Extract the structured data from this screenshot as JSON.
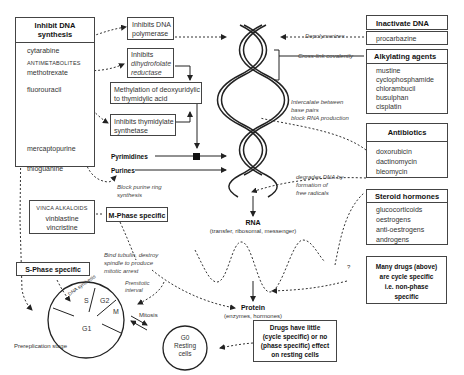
{
  "inhibit_dna_synthesis": {
    "title_line1": "Inhibit DNA",
    "title_line2": "synthesis",
    "drugs": {
      "cytarabine": "cytarabine",
      "antimetabolites_label": "ANTIMETABOLITES",
      "methotrexate": "methotrexate",
      "fluorouracil": "fluorouracil",
      "mercaptopurine": "mercaptopurine",
      "thioguanine": "thioguanine"
    }
  },
  "mechanism_boxes": {
    "dna_polymerase": [
      "Inhibits DNA",
      "polymerase"
    ],
    "dhfr": [
      "Inhibits",
      "dihydrofolate",
      "reductase"
    ],
    "methylation": [
      "Methylation of deoxyuridylic",
      "to thymidylic acid"
    ],
    "thymidylate": [
      "Inhibits thymidylate",
      "synthetase"
    ]
  },
  "labels": {
    "pyrimidines": "Pyrimidines",
    "purines": "Purines",
    "block_purine": [
      "Block purine ring",
      "synthesis"
    ],
    "depolymerizes": "Depolymerizes",
    "cross_link": "Cross-link covalently",
    "intercalate": [
      "Intercalate between",
      "base pairs",
      "block RNA production"
    ],
    "degrades": [
      "degrades DNA by",
      "formation of",
      "free radicals"
    ],
    "rna_title": "RNA",
    "rna_sub": "(transfer, ribosomal, messenger)",
    "protein_title": "Protein",
    "protein_sub": "(enzymes, hormones)",
    "bind_tubulin": [
      "Bind tubulin, destroy",
      "spindle to produce",
      "mitotic arrest"
    ],
    "premitotic": [
      "Premitotic",
      "interval"
    ],
    "mitosis": "Mitosis",
    "prereplication": "Prereplication stage",
    "question": "?"
  },
  "vinca": {
    "label": "VINCA ALKALOIDS",
    "drugs": [
      "vinblastine",
      "vincristine"
    ]
  },
  "m_phase": "M-Phase specific",
  "s_phase": "S-Phase specific",
  "cell_cycle": {
    "dna_synthesis": "DNA synthesis",
    "s": "S",
    "g2": "G2",
    "m": "M",
    "g1": "G1"
  },
  "resting": {
    "g0": "G0",
    "line1": "Resting",
    "line2": "cells"
  },
  "inactivate_dna": {
    "title": "Inactivate DNA",
    "drug": "procarbazine"
  },
  "alkylating": {
    "title": "Alkylating agents",
    "drugs": [
      "mustine",
      "cyclophosphamide",
      "chlorambucil",
      "busulphan",
      "cisplatin"
    ]
  },
  "antibiotics": {
    "title": "Antibiotics",
    "drugs": [
      "doxorubicin",
      "dactinomycin",
      "bleomycin"
    ]
  },
  "steroid": {
    "title": "Steroid hormones",
    "drugs": [
      "glucocorticoids",
      "oestrogens",
      "anti-oestrogens",
      "androgens"
    ]
  },
  "many_drugs": [
    "Many drugs (above)",
    "are cycle specific",
    "i.e. non-phase",
    "specific"
  ],
  "little_effect": [
    "Drugs have little",
    "(cycle specific) or no",
    "(phase specific) effect",
    "on resting cells"
  ]
}
